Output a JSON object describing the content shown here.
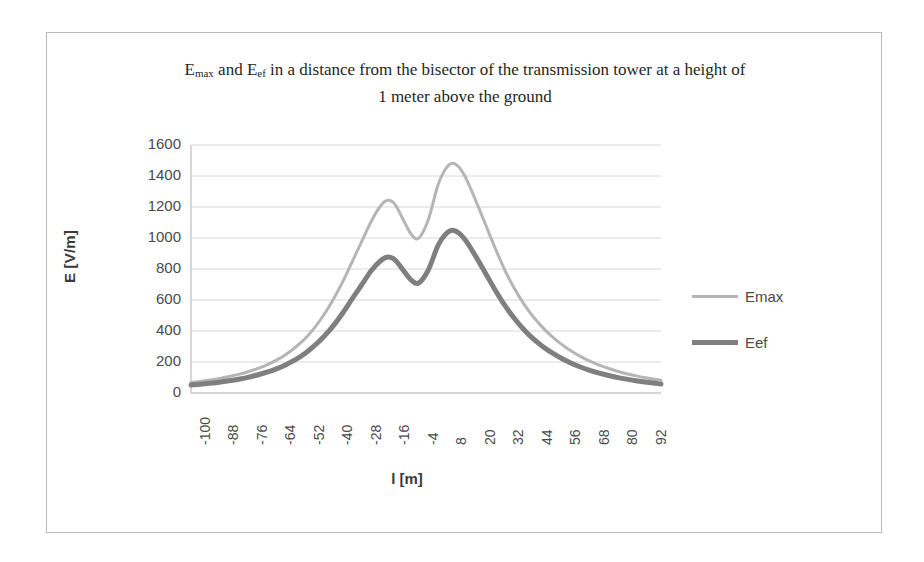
{
  "chart_data": {
    "type": "line",
    "title": "Emax and Eef in a distance from the bisector of the transmission tower at a height of 1 meter above the ground",
    "title_line1_pre": "E",
    "title_line1_sub1": "max",
    "title_line1_mid": " and E",
    "title_line1_sub2": "ef",
    "title_line1_post": " in a distance from the bisector of the transmission tower at a height of",
    "title_line2": "1 meter above the ground",
    "xlabel": "l [m]",
    "ylabel": "E [V/m]",
    "xlim": [
      -100,
      98
    ],
    "ylim": [
      0,
      1600
    ],
    "ytick_values": [
      1600,
      1400,
      1200,
      1000,
      800,
      600,
      400,
      200,
      0
    ],
    "ytick_labels": [
      "1600",
      "1400",
      "1200",
      "1000",
      "800",
      "600",
      "400",
      "200",
      "0"
    ],
    "xtick_labels": [
      "-100",
      "-88",
      "-76",
      "-64",
      "-52",
      "-40",
      "-28",
      "-16",
      "-4",
      "8",
      "20",
      "32",
      "44",
      "56",
      "68",
      "80",
      "92"
    ],
    "xtick_values": [
      -100,
      -88,
      -76,
      -64,
      -52,
      -40,
      -28,
      -16,
      -4,
      8,
      20,
      32,
      44,
      56,
      68,
      80,
      92
    ],
    "grid": true,
    "legend_position": "right",
    "x": [
      -100,
      -96,
      -92,
      -88,
      -84,
      -80,
      -76,
      -72,
      -68,
      -64,
      -60,
      -56,
      -52,
      -48,
      -44,
      -40,
      -36,
      -32,
      -28,
      -24,
      -20,
      -17,
      -14,
      -10,
      -7,
      -4,
      0,
      4,
      7,
      10,
      13,
      16,
      20,
      24,
      28,
      32,
      36,
      40,
      44,
      48,
      52,
      56,
      60,
      64,
      68,
      72,
      76,
      80,
      84,
      88,
      92,
      96,
      98
    ],
    "series": [
      {
        "name": "Emax",
        "color": "#b5b5b5",
        "width": 3,
        "values": [
          68,
          75,
          84,
          94,
          106,
          120,
          137,
          157,
          182,
          212,
          249,
          295,
          350,
          420,
          505,
          605,
          720,
          850,
          980,
          1110,
          1210,
          1243,
          1215,
          1100,
          1020,
          1000,
          1120,
          1340,
          1440,
          1482,
          1455,
          1380,
          1240,
          1090,
          940,
          800,
          680,
          580,
          495,
          425,
          365,
          315,
          272,
          236,
          205,
          180,
          158,
          139,
          123,
          109,
          97,
          87,
          82
        ]
      },
      {
        "name": "Eef",
        "color": "#7f7f7f",
        "width": 5,
        "values": [
          52,
          57,
          63,
          70,
          79,
          89,
          101,
          116,
          134,
          156,
          183,
          215,
          255,
          305,
          365,
          435,
          518,
          610,
          700,
          790,
          855,
          878,
          858,
          780,
          725,
          710,
          795,
          950,
          1020,
          1050,
          1030,
          978,
          880,
          775,
          668,
          570,
          485,
          413,
          352,
          302,
          260,
          224,
          194,
          168,
          146,
          128,
          113,
          99,
          88,
          78,
          69,
          62,
          58
        ]
      }
    ]
  },
  "legend": {
    "items": [
      {
        "label": "Emax"
      },
      {
        "label": "Eef"
      }
    ]
  },
  "colors": {
    "emax": "#b5b5b5",
    "eef": "#7f7f7f",
    "grid": "#d6d6d6",
    "axis": "#bdbdbd",
    "border": "#b9b9b9"
  }
}
